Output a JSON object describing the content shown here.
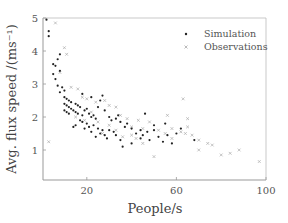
{
  "chart_data": {
    "type": "scatter",
    "title": "",
    "xlabel": "People/s",
    "ylabel": "Avg. flux speed /(ms⁻¹)",
    "xlim": [
      0,
      100
    ],
    "ylim": [
      0.1,
      5
    ],
    "xticks": [
      20,
      60,
      100
    ],
    "yticks": [
      1,
      2,
      3,
      4,
      5
    ],
    "grid": false,
    "legend_position": "upper right",
    "series": [
      {
        "name": "Simulation",
        "marker": "dot",
        "color": "#222222",
        "points": [
          [
            2,
            4.95
          ],
          [
            3,
            4.6
          ],
          [
            3,
            4.45
          ],
          [
            5,
            3.6
          ],
          [
            6,
            3.55
          ],
          [
            7,
            3.75
          ],
          [
            5,
            3.3
          ],
          [
            6,
            3.15
          ],
          [
            8,
            3.4
          ],
          [
            7,
            2.95
          ],
          [
            9,
            2.9
          ],
          [
            10,
            2.8
          ],
          [
            8,
            2.75
          ],
          [
            10,
            2.6
          ],
          [
            11,
            2.55
          ],
          [
            12,
            2.5
          ],
          [
            13,
            2.45
          ],
          [
            10,
            2.4
          ],
          [
            11,
            2.35
          ],
          [
            12,
            2.3
          ],
          [
            13,
            2.25
          ],
          [
            10,
            2.2
          ],
          [
            11,
            2.15
          ],
          [
            12,
            2.1
          ],
          [
            14,
            2.2
          ],
          [
            15,
            2.4
          ],
          [
            16,
            2.35
          ],
          [
            17,
            2.3
          ],
          [
            15,
            2.15
          ],
          [
            16,
            2.1
          ],
          [
            18,
            2.05
          ],
          [
            19,
            2.2
          ],
          [
            20,
            2.25
          ],
          [
            21,
            2.1
          ],
          [
            22,
            2.0
          ],
          [
            23,
            2.05
          ],
          [
            24,
            1.95
          ],
          [
            17,
            1.9
          ],
          [
            18,
            1.85
          ],
          [
            20,
            1.8
          ],
          [
            21,
            1.7
          ],
          [
            23,
            1.75
          ],
          [
            25,
            1.65
          ],
          [
            27,
            1.6
          ],
          [
            19,
            1.65
          ],
          [
            22,
            1.55
          ],
          [
            26,
            1.5
          ],
          [
            28,
            1.45
          ],
          [
            30,
            1.6
          ],
          [
            32,
            1.55
          ],
          [
            14,
            1.7
          ],
          [
            15,
            1.75
          ],
          [
            24,
            1.4
          ],
          [
            29,
            1.35
          ],
          [
            33,
            1.45
          ],
          [
            35,
            1.3
          ],
          [
            25,
            2.3
          ],
          [
            28,
            2.2
          ],
          [
            30,
            2.0
          ],
          [
            31,
            1.9
          ],
          [
            33,
            1.95
          ],
          [
            35,
            1.85
          ],
          [
            37,
            1.7
          ],
          [
            38,
            1.8
          ],
          [
            40,
            1.65
          ],
          [
            42,
            1.5
          ],
          [
            44,
            1.6
          ],
          [
            45,
            1.45
          ],
          [
            47,
            1.55
          ],
          [
            48,
            1.3
          ],
          [
            50,
            1.6
          ],
          [
            52,
            1.4
          ],
          [
            54,
            1.25
          ],
          [
            56,
            1.45
          ],
          [
            58,
            1.2
          ],
          [
            46,
            2.1
          ],
          [
            50,
            1.75
          ],
          [
            55,
            1.8
          ],
          [
            62,
            1.65
          ],
          [
            68,
            1.3
          ],
          [
            36,
            1.1
          ],
          [
            40,
            1.2
          ],
          [
            26,
            2.5
          ],
          [
            22,
            2.6
          ],
          [
            18,
            2.7
          ],
          [
            27,
            2.65
          ],
          [
            34,
            2.05
          ],
          [
            44,
            1.35
          ],
          [
            60,
            1.5
          ],
          [
            8,
            3.9
          ]
        ]
      },
      {
        "name": "Observations",
        "marker": "cross",
        "color": "#aaaaaa",
        "points": [
          [
            6,
            4.85
          ],
          [
            10,
            4.1
          ],
          [
            11,
            3.9
          ],
          [
            8,
            3.35
          ],
          [
            13,
            2.9
          ],
          [
            16,
            2.85
          ],
          [
            18,
            2.6
          ],
          [
            20,
            2.55
          ],
          [
            24,
            2.45
          ],
          [
            28,
            2.5
          ],
          [
            30,
            2.35
          ],
          [
            33,
            2.3
          ],
          [
            15,
            2.0
          ],
          [
            19,
            1.9
          ],
          [
            25,
            1.85
          ],
          [
            30,
            1.75
          ],
          [
            35,
            2.05
          ],
          [
            38,
            1.95
          ],
          [
            40,
            1.7
          ],
          [
            43,
            1.9
          ],
          [
            45,
            1.65
          ],
          [
            48,
            1.85
          ],
          [
            52,
            1.6
          ],
          [
            55,
            1.5
          ],
          [
            58,
            1.65
          ],
          [
            62,
            1.55
          ],
          [
            64,
            1.5
          ],
          [
            65,
            1.7
          ],
          [
            65,
            1.95
          ],
          [
            67,
            1.45
          ],
          [
            70,
            1.3
          ],
          [
            74,
            1.2
          ],
          [
            80,
            0.85
          ],
          [
            84,
            0.9
          ],
          [
            88,
            1.0
          ],
          [
            97,
            0.65
          ],
          [
            50,
            0.8
          ],
          [
            56,
            2.05
          ],
          [
            40,
            1.45
          ],
          [
            33,
            1.6
          ],
          [
            3,
            1.25
          ],
          [
            63,
            2.55
          ],
          [
            45,
            1.2
          ],
          [
            42,
            1.35
          ],
          [
            22,
            2.15
          ],
          [
            27,
            1.5
          ],
          [
            36,
            1.4
          ],
          [
            58,
            1.35
          ],
          [
            70,
            1.0
          ],
          [
            76,
            1.15
          ]
        ]
      }
    ]
  },
  "legend": {
    "items": [
      {
        "label": "Simulation"
      },
      {
        "label": "Observations"
      }
    ]
  },
  "axes": {
    "xlabel": "People/s",
    "ylabel": "Avg. flux speed /(ms⁻¹)",
    "xtick_labels": [
      "20",
      "60",
      "100"
    ],
    "ytick_labels": [
      "1",
      "2",
      "3",
      "4",
      "5"
    ]
  }
}
